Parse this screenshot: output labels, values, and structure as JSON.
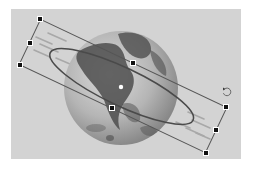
{
  "canvas": {
    "background": "#d3d3d3",
    "page_background": "#ffffff"
  },
  "globe": {
    "label": "globe-image",
    "cx": 121,
    "cy": 88,
    "r": 57,
    "colors": {
      "ocean_light": "#c9c9c9",
      "ocean_dark": "#8e8e8e",
      "land": "#4a4a4a"
    }
  },
  "selection": {
    "shape": "ellipse",
    "rotation_deg": 25.3,
    "center": [
      123,
      86
    ],
    "box_width": 206,
    "box_height": 50,
    "ellipse_rx": 79,
    "ellipse_ry": 19,
    "stroke_color": "#555555",
    "handles": [
      {
        "name": "handle-top-left",
        "x": 40,
        "y": 19
      },
      {
        "name": "handle-middle-left",
        "x": 30,
        "y": 43
      },
      {
        "name": "handle-bottom-left",
        "x": 20,
        "y": 65
      },
      {
        "name": "handle-top-middle",
        "x": 133,
        "y": 63
      },
      {
        "name": "handle-bottom-middle",
        "x": 112,
        "y": 108
      },
      {
        "name": "handle-top-right",
        "x": 226,
        "y": 107
      },
      {
        "name": "handle-middle-right",
        "x": 216,
        "y": 130
      },
      {
        "name": "handle-bottom-right",
        "x": 206,
        "y": 153
      }
    ],
    "center_point": {
      "x": 121,
      "y": 87
    },
    "rotate_handle": {
      "x": 227,
      "y": 92,
      "icon": "rotate-icon"
    }
  }
}
